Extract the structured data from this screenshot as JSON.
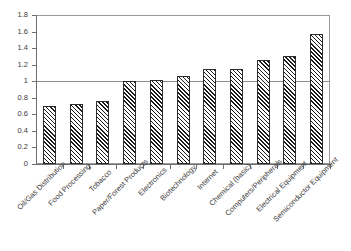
{
  "chart_data": {
    "type": "bar",
    "title": "",
    "subtitle": "",
    "xlabel": "",
    "ylabel": "",
    "ylim": [
      0,
      1.8
    ],
    "ytick_step": 0.2,
    "grid": false,
    "legend": "none",
    "reference_line": {
      "value": 1,
      "label": "1.0"
    },
    "categories": [
      "Oil/Gas Distribution",
      "Food Processing",
      "Tobacco",
      "Paper/Forest Products",
      "Electronics",
      "Biotechnology",
      "Internet",
      "Chemical (basic)",
      "Computers/Peripherals",
      "Electrical Equipment",
      "Semiconductor Equipment"
    ],
    "values": [
      0.7,
      0.73,
      0.76,
      1.0,
      1.01,
      1.06,
      1.15,
      1.15,
      1.26,
      1.3,
      1.57
    ],
    "ytick_labels": [
      "0",
      "0.2",
      "0.4",
      "0.6",
      "0.8",
      "1",
      "1.2",
      "1.4",
      "1.6",
      "1.8"
    ],
    "ytick_values": [
      0,
      0.2,
      0.4,
      0.6,
      0.8,
      1.0,
      1.2,
      1.4,
      1.6,
      1.8
    ],
    "colors": {
      "bar_fill": "#ffffff",
      "bar_hatch": "#1a1a1a",
      "bar_outline": "#2b2b2b",
      "axis": "#6f6f6f",
      "frame": "#9a9a9a",
      "reference_line": "#8c8c8c",
      "text": "#3a3a3a",
      "background": "#ffffff"
    }
  }
}
